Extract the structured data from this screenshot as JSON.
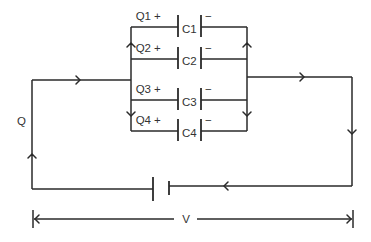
{
  "diagram": {
    "source_label": "Q",
    "voltage_label": "V",
    "capacitors": [
      {
        "charge_label": "Q1",
        "name": "C1",
        "plus": "+",
        "minus": "−"
      },
      {
        "charge_label": "Q2",
        "name": "C2",
        "plus": "+",
        "minus": "−"
      },
      {
        "charge_label": "Q3",
        "name": "C3",
        "plus": "+",
        "minus": "−"
      },
      {
        "charge_label": "Q4",
        "name": "C4",
        "plus": "+",
        "minus": "−"
      }
    ],
    "colors": {
      "line": "#2a2a2a",
      "text": "#333333",
      "background": "#ffffff"
    }
  }
}
